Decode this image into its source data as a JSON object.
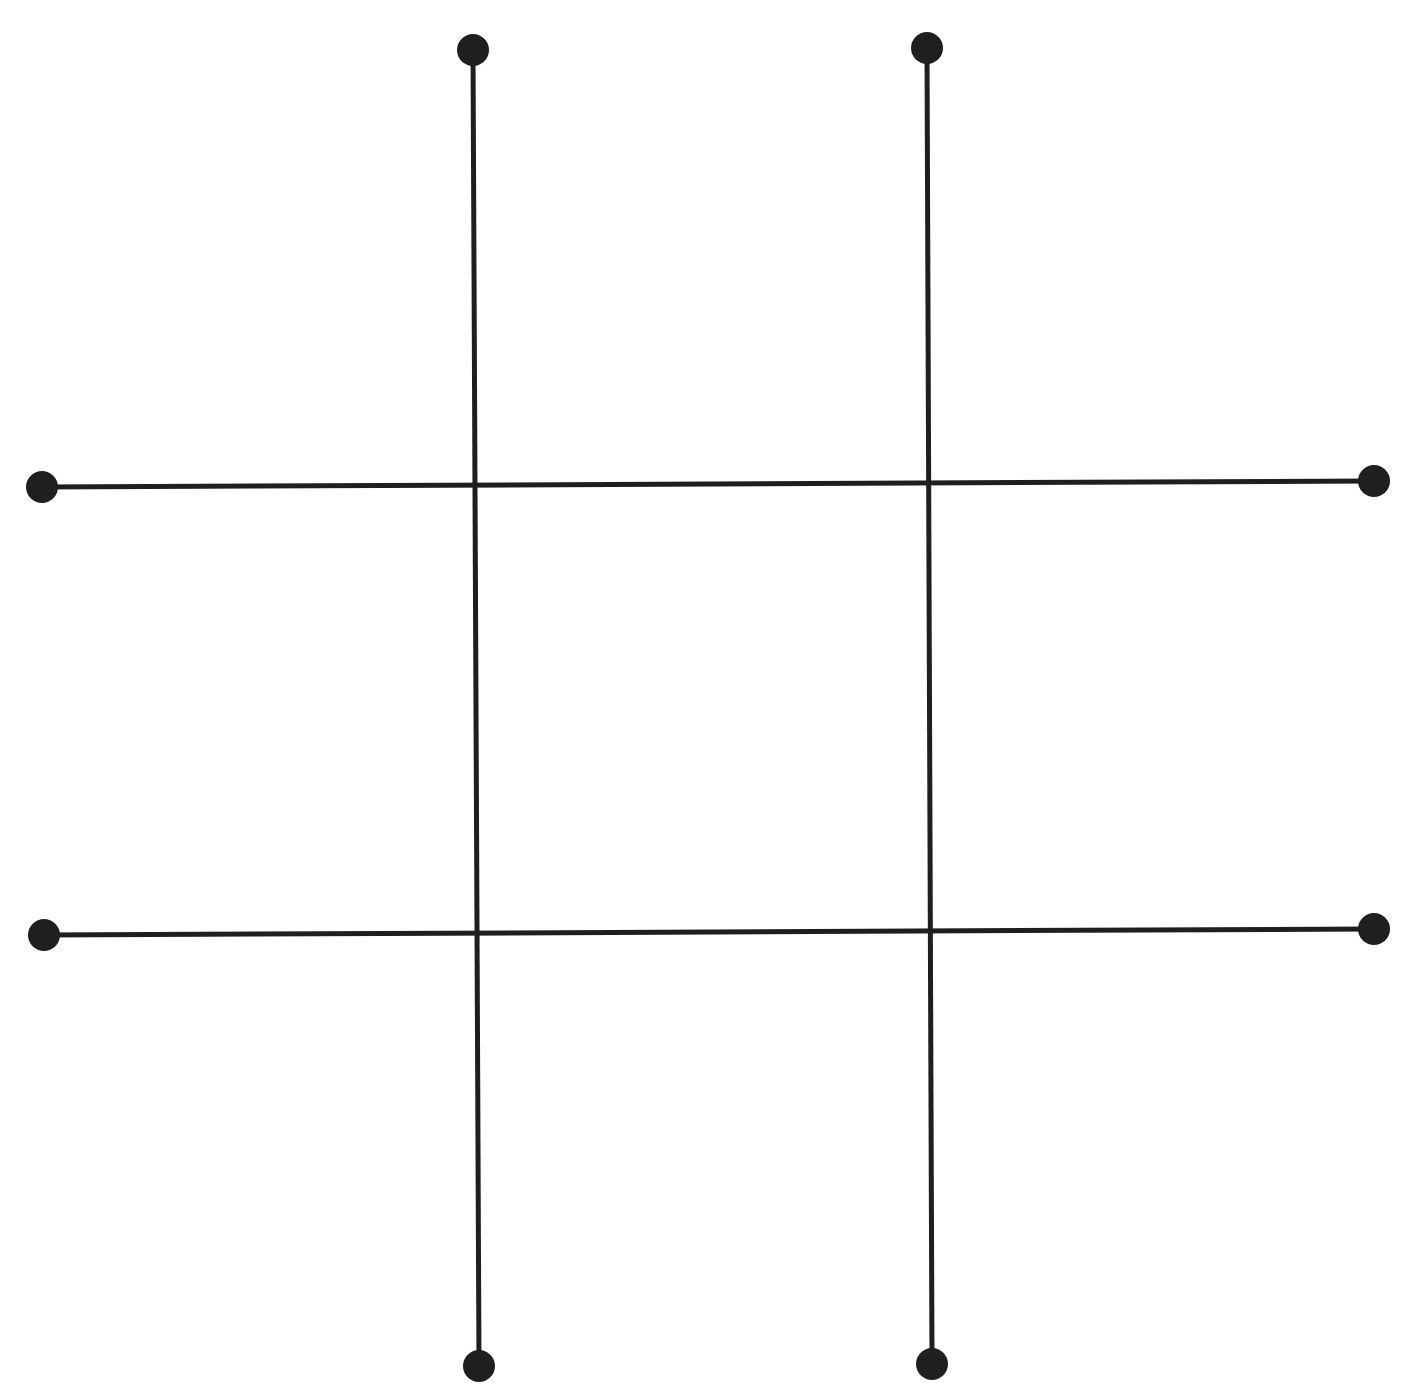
{
  "diagram": {
    "type": "tic-tac-toe-grid",
    "color": "#1f1f1f",
    "line_width": 5,
    "dot_radius": 16,
    "lines": [
      {
        "id": "vertical-left",
        "x1": 473,
        "y1": 50,
        "x2": 479,
        "y2": 1366
      },
      {
        "id": "vertical-right",
        "x1": 927,
        "y1": 48,
        "x2": 932,
        "y2": 1364
      },
      {
        "id": "horizontal-top",
        "x1": 42,
        "y1": 487,
        "x2": 1374,
        "y2": 481
      },
      {
        "id": "horizontal-bottom",
        "x1": 44,
        "y1": 935,
        "x2": 1374,
        "y2": 929
      }
    ]
  }
}
